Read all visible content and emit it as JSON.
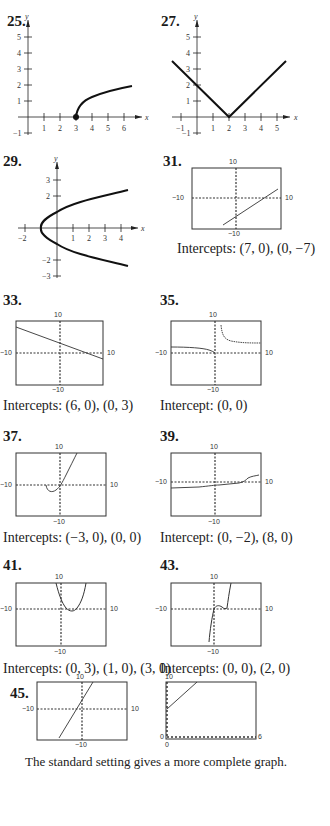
{
  "page": {
    "footer_caption": "The standard setting gives a more complete graph."
  },
  "problems": [
    {
      "number": "25.",
      "type": "hand-drawn graph",
      "x_ticks": [
        "1",
        "2",
        "3",
        "4",
        "5",
        "6"
      ],
      "y_ticks": [
        "5",
        "4",
        "3",
        "2",
        "1",
        "−1"
      ],
      "x_label": "x",
      "y_label": "y",
      "caption": ""
    },
    {
      "number": "27.",
      "type": "hand-drawn graph",
      "x_ticks": [
        "−1",
        "1",
        "2",
        "3",
        "4",
        "5"
      ],
      "y_ticks": [
        "5",
        "4",
        "3",
        "2",
        "1",
        "−1"
      ],
      "x_label": "x",
      "y_label": "y",
      "caption": ""
    },
    {
      "number": "29.",
      "type": "hand-drawn graph",
      "x_ticks": [
        "−2",
        "1",
        "2",
        "3",
        "4"
      ],
      "y_ticks": [
        "3",
        "2",
        "−2",
        "−3"
      ],
      "x_label": "x",
      "y_label": "y",
      "caption": ""
    },
    {
      "number": "31.",
      "type": "calculator window",
      "window": {
        "top": "10",
        "bottom": "−10",
        "left": "−10",
        "right": "10"
      },
      "caption": "Intercepts:  (7, 0), (0, −7)"
    },
    {
      "number": "33.",
      "type": "calculator window",
      "window": {
        "top": "10",
        "bottom": "−10",
        "left": "−10",
        "right": "10"
      },
      "caption": "Intercepts:  (6, 0), (0, 3)"
    },
    {
      "number": "35.",
      "type": "calculator window",
      "window": {
        "top": "10",
        "bottom": "−10",
        "left": "−10",
        "right": "10"
      },
      "caption": "Intercept:  (0, 0)"
    },
    {
      "number": "37.",
      "type": "calculator window",
      "window": {
        "top": "10",
        "bottom": "−10",
        "left": "−10",
        "right": "10"
      },
      "caption": "Intercepts:  (−3, 0), (0, 0)"
    },
    {
      "number": "39.",
      "type": "calculator window",
      "window": {
        "top": "10",
        "bottom": "−10",
        "left": "−10",
        "right": "10"
      },
      "caption": "Intercept:  (0, −2), (8, 0)"
    },
    {
      "number": "41.",
      "type": "calculator window",
      "window": {
        "top": "10",
        "bottom": "−10",
        "left": "−10",
        "right": "10"
      },
      "caption": "Intercepts:  (0, 3), (1, 0), (3, 0)"
    },
    {
      "number": "43.",
      "type": "calculator window",
      "window": {
        "top": "10",
        "bottom": "−10",
        "left": "−10",
        "right": "10"
      },
      "caption": "Intercepts:  (0, 0), (2, 0)"
    },
    {
      "number": "45.",
      "type": "calculator windows",
      "window": {
        "top": "10",
        "bottom": "−10",
        "left": "−10",
        "right": "10"
      },
      "window2": {
        "top": "10",
        "bottom": "0",
        "left": "0",
        "right": "6"
      },
      "caption": ""
    }
  ]
}
